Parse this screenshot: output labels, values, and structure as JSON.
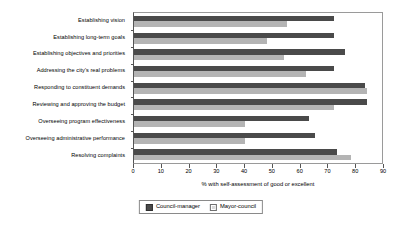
{
  "chart_data": {
    "type": "bar",
    "orientation": "horizontal",
    "title": "",
    "xlabel": "% with self-assessment of good or excellent",
    "ylabel": "",
    "xlim": [
      0,
      90
    ],
    "xticks": [
      0,
      10,
      20,
      30,
      40,
      50,
      60,
      70,
      80,
      90
    ],
    "grid": false,
    "legend_position": "bottom",
    "categories": [
      "Establishing vision",
      "Establishing long-term goals",
      "Establishing objectives and priorities",
      "Addressing the city's real problems",
      "Responding to constituent demands",
      "Reviewing and approving the budget",
      "Overseeing program effectiveness",
      "Overseeing administrative performance",
      "Resolving complaints"
    ],
    "series": [
      {
        "name": "Council-manager",
        "color": "#4a4a4a",
        "values": [
          72,
          72,
          76,
          72,
          83,
          84,
          63,
          65,
          73
        ]
      },
      {
        "name": "Mayor-council",
        "color": "#b4b4b4",
        "values": [
          55,
          48,
          54,
          62,
          84,
          72,
          40,
          40,
          78
        ]
      }
    ]
  }
}
